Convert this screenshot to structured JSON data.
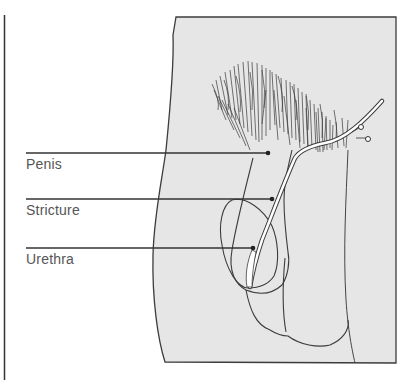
{
  "figure": {
    "type": "anatomical-line-drawing",
    "colors": {
      "panel_fill": "#e6e6e6",
      "outline": "#3c3c3c",
      "label_text": "#555555",
      "leader_line": "#333333",
      "catheter": "#ffffff"
    }
  },
  "labels": [
    {
      "id": "penis",
      "text": "Penis"
    },
    {
      "id": "stricture",
      "text": "Stricture"
    },
    {
      "id": "urethra",
      "text": "Urethra"
    }
  ]
}
